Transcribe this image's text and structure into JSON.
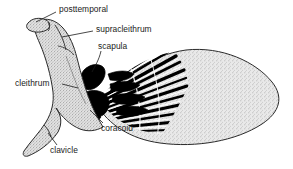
{
  "figure": {
    "kind": "anatomical-line-drawing",
    "background_color": "#ffffff",
    "ink_color": "#1a1a1a",
    "stipple_color": "#b9b9b9",
    "solid_bone_color": "#000000"
  },
  "labels": [
    {
      "id": "posttemporal",
      "text": "posttemporal",
      "x": 59,
      "y": 9
    },
    {
      "id": "supracleithrum",
      "text": "supracleithrum",
      "x": 96,
      "y": 29
    },
    {
      "id": "scapula",
      "text": "scapula",
      "x": 98,
      "y": 46
    },
    {
      "id": "cleithrum",
      "text": "cleithrum",
      "x": 15,
      "y": 83
    },
    {
      "id": "coracoid",
      "text": "coracoid",
      "x": 101,
      "y": 128
    },
    {
      "id": "clavicle",
      "text": "clavicle",
      "x": 50,
      "y": 150
    }
  ],
  "leader_lines": [
    {
      "for": "posttemporal",
      "from": [
        56,
        13
      ],
      "to": [
        36,
        22
      ]
    },
    {
      "for": "supracleithrum",
      "from": [
        93,
        32
      ],
      "to": [
        62,
        37
      ]
    },
    {
      "for": "scapula",
      "from": [
        101,
        52
      ],
      "to": [
        93,
        72
      ]
    },
    {
      "for": "cleithrum",
      "from": [
        63,
        85
      ],
      "to": [
        77,
        89
      ]
    },
    {
      "for": "coracoid",
      "from": [
        103,
        124
      ],
      "to": [
        90,
        110
      ]
    },
    {
      "for": "clavicle",
      "from": [
        56,
        146
      ],
      "to": [
        48,
        133
      ]
    }
  ],
  "structures": [
    {
      "id": "posttemporal",
      "fill": "stipple",
      "note": "small elongate element at upper-left tip of girdle"
    },
    {
      "id": "supracleithrum",
      "fill": "stipple",
      "note": "bone below posttemporal, upper arm of the girdle"
    },
    {
      "id": "cleithrum",
      "fill": "stipple",
      "note": "large curved boomerang-shaped bone forming girdle shaft"
    },
    {
      "id": "clavicle",
      "fill": "stipple",
      "note": "slender element on lower-left arm of girdle"
    },
    {
      "id": "scapula",
      "fill": "solid-black",
      "note": "upper black block at fin base"
    },
    {
      "id": "coracoid",
      "fill": "solid-black",
      "note": "lower black block at fin base"
    },
    {
      "id": "radials",
      "fill": "solid-black",
      "note": "row of black blocks between girdle and fin rays"
    },
    {
      "id": "fin-rays",
      "fill": "solid-black",
      "note": "radiating black rays fanning into the fin"
    },
    {
      "id": "fin-blade",
      "fill": "stipple",
      "note": "large stippled leaf-shaped fin tapering to the right"
    }
  ]
}
